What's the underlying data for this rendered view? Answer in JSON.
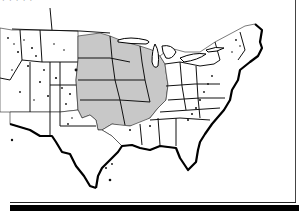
{
  "map": {
    "caption": "· · · · ·",
    "subject": "Continental United States",
    "highlighted_region": "Upper Midwest / Mississippi basin states",
    "highlighted_states": [
      "Minnesota",
      "Iowa",
      "Missouri",
      "Wisconsin",
      "Illinois",
      "North Dakota (east)",
      "South Dakota (east)",
      "Nebraska (east)",
      "Kansas (east)",
      "Oklahoma (east)",
      "Arkansas (north)"
    ],
    "colors": {
      "background": "#ffffff",
      "highlight": "#c8c8c8",
      "outline": "#000000",
      "bottom_bar": "#000000"
    }
  }
}
